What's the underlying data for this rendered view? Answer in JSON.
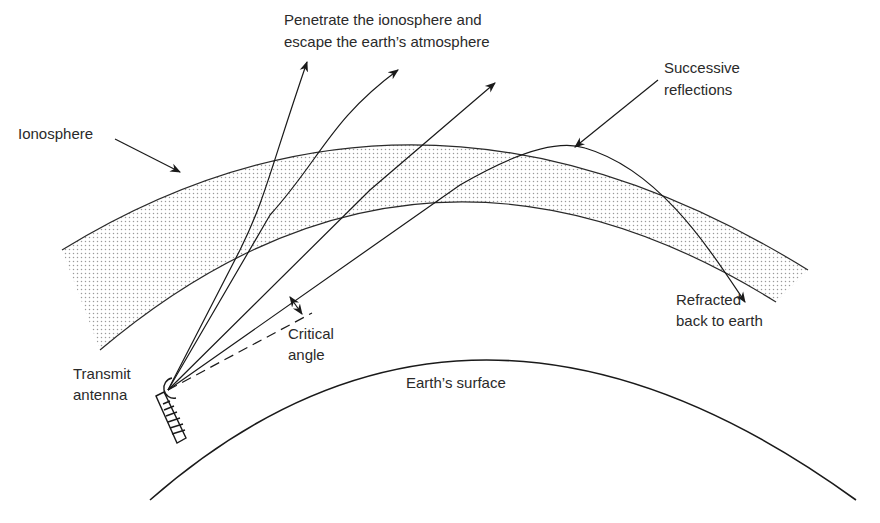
{
  "diagram": {
    "labels": {
      "escape_line1": "Penetrate the ionosphere and",
      "escape_line2": "escape the earth’s atmosphere",
      "ionosphere": "Ionosphere",
      "successive_line1": "Successive",
      "successive_line2": "reflections",
      "refracted_line1": "Refracted",
      "refracted_line2": "back to earth",
      "critical_line1": "Critical",
      "critical_line2": "angle",
      "transmit_line1": "Transmit",
      "transmit_line2": "antenna",
      "earth_surface": "Earth’s surface"
    },
    "elements": [
      {
        "id": "ionosphere-band",
        "type": "stippled-arc-band"
      },
      {
        "id": "earth-surface",
        "type": "arc"
      },
      {
        "id": "transmit-antenna",
        "type": "tower-with-dish"
      },
      {
        "id": "escaping-rays",
        "count": 3
      },
      {
        "id": "refracted-ray",
        "count": 1
      },
      {
        "id": "critical-angle-ray",
        "style": "dashed"
      }
    ],
    "colors": {
      "line": "#1a1a1a",
      "stipple": "#9a9a9a",
      "text": "#2a2a2a",
      "background": "#ffffff"
    }
  }
}
